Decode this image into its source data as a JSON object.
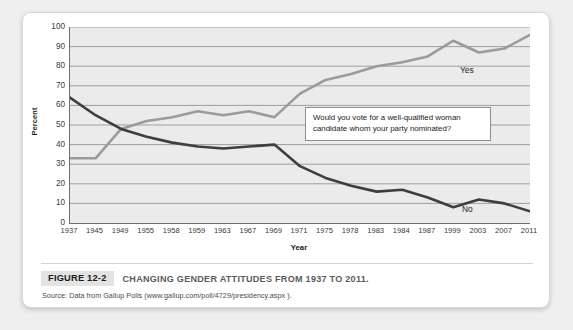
{
  "figure": {
    "number_label": "FIGURE 12-2",
    "title": "CHANGING GENDER ATTITUDES FROM 1937 TO 2011.",
    "source": "Source: Data from Gallup Polls (www.gallup.com/poll/4729/presidency.aspx )."
  },
  "annotation": {
    "text": "Would you vote for a well-qualified woman candidate whom your party nominated?"
  },
  "colors": {
    "yes_line": "#9b9b9b",
    "no_line": "#3e3e3e",
    "plot_background": "#ebebeb",
    "gridline": "#8a8a8a",
    "card_background": "#ffffff",
    "page_background": "#efefef"
  },
  "chart_data": {
    "type": "line",
    "title": "CHANGING GENDER ATTITUDES FROM 1937 TO 2011.",
    "xlabel": "Year",
    "ylabel": "Percent",
    "ylim": [
      0,
      100
    ],
    "ytick_step": 10,
    "ytick_labels": [
      "100",
      "90",
      "80",
      "70",
      "60",
      "50",
      "40",
      "30",
      "20",
      "10",
      "0"
    ],
    "grid": true,
    "legend_position": "inline-right",
    "categories": [
      "1937",
      "1945",
      "1949",
      "1955",
      "1958",
      "1959",
      "1963",
      "1967",
      "1969",
      "1971",
      "1975",
      "1978",
      "1983",
      "1984",
      "1987",
      "1999",
      "2003",
      "2007",
      "2011"
    ],
    "series": [
      {
        "name": "Yes",
        "color": "#9b9b9b",
        "values": [
          33,
          33,
          48,
          52,
          54,
          57,
          55,
          57,
          54,
          66,
          73,
          76,
          80,
          82,
          85,
          93,
          87,
          89,
          96
        ]
      },
      {
        "name": "No",
        "color": "#3e3e3e",
        "values": [
          64,
          55,
          48,
          44,
          41,
          39,
          38,
          39,
          40,
          29,
          23,
          19,
          16,
          17,
          13,
          8,
          12,
          10,
          6
        ]
      }
    ],
    "annotations": [
      "Would you vote for a well-qualified woman candidate whom your party nominated?"
    ]
  }
}
